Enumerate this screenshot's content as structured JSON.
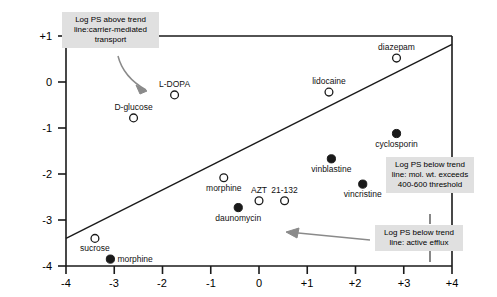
{
  "chart_data": {
    "type": "scatter",
    "title": "",
    "xlabel": "",
    "ylabel": "",
    "xlim": [
      -4,
      4
    ],
    "ylim": [
      -4,
      1
    ],
    "grid": false,
    "legend_position": "none",
    "x_ticks": [
      "-4",
      "-3",
      "-2",
      "-1",
      "0",
      "+1",
      "+2",
      "+3",
      "+4"
    ],
    "x_tick_values": [
      -4,
      -3,
      -2,
      -1,
      0,
      1,
      2,
      3,
      4
    ],
    "y_ticks": [
      "+1",
      "0",
      "-1",
      "-2",
      "-3",
      "-4"
    ],
    "y_tick_values": [
      1,
      0,
      -1,
      -2,
      -3,
      -4
    ],
    "trend_line": {
      "x": [
        -4,
        4
      ],
      "y": [
        -3.4,
        0.82
      ],
      "style": "solid",
      "color": "#1a1a1a"
    },
    "series": [
      {
        "name": "open-marker",
        "marker": "open-circle",
        "color": "#ffffff",
        "edge_color": "#1a1a1a",
        "points": [
          {
            "label": "L-DOPA",
            "x": -1.75,
            "y": -0.28,
            "label_pos": "top"
          },
          {
            "label": "D-glucose",
            "x": -2.6,
            "y": -0.78,
            "label_pos": "top"
          },
          {
            "label": "lidocaine",
            "x": 1.45,
            "y": -0.22,
            "label_pos": "top"
          },
          {
            "label": "diazepam",
            "x": 2.85,
            "y": 0.52,
            "label_pos": "top"
          },
          {
            "label": "morphine",
            "x": -0.73,
            "y": -2.08,
            "label_pos": "bottom"
          },
          {
            "label": "AZT",
            "x": 0.0,
            "y": -2.58,
            "label_pos": "top"
          },
          {
            "label": "21-132",
            "x": 0.53,
            "y": -2.58,
            "label_pos": "top"
          },
          {
            "label": "sucrose",
            "x": -3.4,
            "y": -3.4,
            "label_pos": "bottom"
          }
        ]
      },
      {
        "name": "filled-marker",
        "marker": "filled-circle",
        "color": "#1a1a1a",
        "edge_color": "#1a1a1a",
        "points": [
          {
            "label": "cyclosporin",
            "x": 2.85,
            "y": -1.12,
            "label_pos": "bottom"
          },
          {
            "label": "vinblastine",
            "x": 1.5,
            "y": -1.67,
            "label_pos": "bottom"
          },
          {
            "label": "vincristine",
            "x": 2.15,
            "y": -2.22,
            "label_pos": "bottom"
          },
          {
            "label": "daunomycin",
            "x": -0.43,
            "y": -2.73,
            "label_pos": "bottom"
          },
          {
            "label": "morphine",
            "x": -3.08,
            "y": -3.85,
            "label_pos": "right"
          }
        ]
      }
    ],
    "annotations": [
      {
        "id": "above-trend",
        "text": "Log PS above trend line:carrier-mediated transport",
        "arrow": "curved-down-right"
      },
      {
        "id": "below-trend-molwt",
        "text": "Log PS below trend line: mol. wt. exceeds 400-600 threshold",
        "arrow": "vertical-down"
      },
      {
        "id": "below-trend-efflux",
        "text": "Log PS below trend line: active efflux",
        "arrow": "horizontal-left"
      }
    ]
  }
}
